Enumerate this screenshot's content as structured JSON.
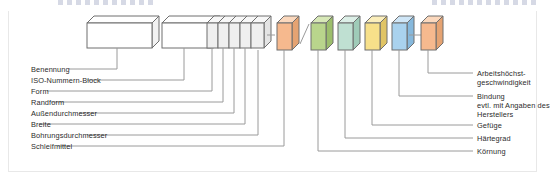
{
  "page": {
    "title_fragment_left": "",
    "title_fragment_right": "",
    "background": "#ffffff",
    "rule_color": "#4a568c0"
  },
  "diagram": {
    "name": "grinding-wheel-iso-designation-diagram",
    "blocks": [
      {
        "id": "benennung",
        "label_ref": "left.0",
        "fill": "#ffffff",
        "top": "#ffffff",
        "side": "#f0f0f0",
        "x": 86,
        "y": 15,
        "w": 58,
        "h": 32
      },
      {
        "id": "iso-nummern-block",
        "label_ref": "left.1",
        "fill": "#ffffff",
        "top": "#ffffff",
        "side": "#f0f0f0",
        "x": 152,
        "y": 15,
        "w": 40,
        "h": 32
      },
      {
        "id": "form",
        "label_ref": "left.2",
        "fill": "#efefef",
        "top": "#f7f7f7",
        "side": "#e2e2e2",
        "x": 196,
        "y": 17,
        "w": 9,
        "h": 30
      },
      {
        "id": "randform",
        "label_ref": "left.3",
        "fill": "#efefef",
        "top": "#f7f7f7",
        "side": "#e2e2e2",
        "x": 206,
        "y": 17,
        "w": 9,
        "h": 30
      },
      {
        "id": "aussendurchmesser",
        "label_ref": "left.4",
        "fill": "#efefef",
        "top": "#f7f7f7",
        "side": "#e2e2e2",
        "x": 216,
        "y": 17,
        "w": 9,
        "h": 30
      },
      {
        "id": "breite",
        "label_ref": "left.5",
        "fill": "#efefef",
        "top": "#f7f7f7",
        "side": "#e2e2e2",
        "x": 226,
        "y": 17,
        "w": 9,
        "h": 30
      },
      {
        "id": "bohrungsdurchmesser",
        "label_ref": "left.6",
        "fill": "#efefef",
        "top": "#f7f7f7",
        "side": "#e2e2e2",
        "x": 236,
        "y": 17,
        "w": 11,
        "h": 30
      },
      {
        "id": "schleifmittel",
        "label_ref": "left.7",
        "fill": "#f6b98e",
        "top": "#fbd8bd",
        "side": "#e09a68",
        "x": 262,
        "y": 17,
        "w": 14,
        "h": 30
      },
      {
        "id": "koernung",
        "label_ref": "right.4",
        "fill": "#b9d58c",
        "top": "#d7e8b7",
        "side": "#9cbe6c",
        "x": 290,
        "y": 17,
        "w": 14,
        "h": 30
      },
      {
        "id": "haertegrad",
        "label_ref": "right.3",
        "fill": "#bfe0d2",
        "top": "#dcefe7",
        "side": "#9fcbb8",
        "x": 313,
        "y": 17,
        "w": 14,
        "h": 30
      },
      {
        "id": "gefuege",
        "label_ref": "right.2",
        "fill": "#f7e08a",
        "top": "#fbeebb",
        "side": "#e0c465",
        "x": 336,
        "y": 17,
        "w": 14,
        "h": 30
      },
      {
        "id": "bindung",
        "label_ref": "right.1",
        "fill": "#a9d2ee",
        "top": "#cfe6f7",
        "side": "#86b8dc",
        "x": 367,
        "y": 17,
        "w": 14,
        "h": 30
      },
      {
        "id": "arbeitshoechstgeschwindigkeit",
        "label_ref": "right.0",
        "fill": "#f6b98e",
        "top": "#fbd8bd",
        "side": "#e09a68",
        "x": 394,
        "y": 17,
        "w": 14,
        "h": 30
      }
    ],
    "left_labels": [
      "Benennung",
      "ISO-Nummern-Block",
      "Form",
      "Randform",
      "Außendurchmesser",
      "Breite",
      "Bohrungsdurchmesser",
      "Schleifmittel"
    ],
    "right_labels": [
      "Arbeitshöchst-\ngeschwindigkeit",
      "Bindung\nevtl. mit Angaben des\nHerstellers",
      "Gefüge",
      "Härtegrad",
      "Körnung"
    ]
  }
}
